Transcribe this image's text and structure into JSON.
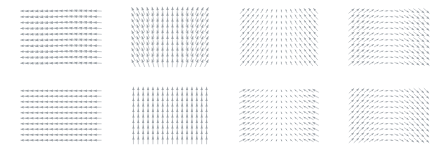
{
  "figure": {
    "title": "",
    "background_color": "#ffffff",
    "arrow_color": "#9aa0a6",
    "width": 441,
    "height": 151,
    "rows": 2,
    "cols": 4,
    "panel_count": 8
  },
  "chart_data": {
    "type": "quiver",
    "title": "",
    "xlabel": "",
    "ylabel": "",
    "grid": false,
    "legend": null,
    "axes_visible": false,
    "tick_labels": [],
    "layout": {
      "rows": 2,
      "cols": 4
    },
    "grid_shape": {
      "nx": 16,
      "ny": 10
    },
    "domain": {
      "xlim": [
        -1,
        1
      ],
      "ylim": [
        -1,
        1
      ]
    },
    "panels": [
      {
        "index": 0,
        "row": 0,
        "col": 0,
        "label": "",
        "field": "horizontal-leftward-wave",
        "description": "Near-horizontal arrows pointing left with a gentle vertical undulation; magnitude roughly uniform.",
        "u_expr": "-1",
        "v_expr": "0.22*sin(3.1*x)",
        "scale": 1.0,
        "bounds_px": {
          "x": 22,
          "y": 8,
          "w": 78,
          "h": 58
        }
      },
      {
        "index": 1,
        "row": 0,
        "col": 1,
        "label": "",
        "field": "vertical-fan-shear",
        "description": "Near-vertical arrows fanning: tilted backslash on the left, upright in the middle, forward slash on the right.",
        "u_expr": "0.55*x",
        "v_expr": "1",
        "scale": 1.0,
        "bounds_px": {
          "x": 131,
          "y": 8,
          "w": 78,
          "h": 58
        }
      },
      {
        "index": 2,
        "row": 0,
        "col": 2,
        "label": "",
        "field": "convergent-shear",
        "description": "Arrows tilt inward toward the vertical centre line; magnitude shrinks near the middle column.",
        "u_expr": "-0.75*x",
        "v_expr": "0.9",
        "scale": 0.85,
        "bounds_px": {
          "x": 240,
          "y": 8,
          "w": 78,
          "h": 58
        }
      },
      {
        "index": 3,
        "row": 0,
        "col": 3,
        "label": "",
        "field": "divergent-source",
        "description": "Forward-slash arrows on the left, flat horizontal through the centre, backslash on the right; outflow pattern.",
        "u_expr": "1",
        "v_expr": "-0.85*x",
        "scale": 0.9,
        "bounds_px": {
          "x": 349,
          "y": 8,
          "w": 80,
          "h": 58
        }
      },
      {
        "index": 4,
        "row": 1,
        "col": 0,
        "label": "",
        "field": "uniform-horizontal",
        "description": "Uniform horizontal arrows pointing left; constant magnitude across the grid.",
        "u_expr": "-1",
        "v_expr": "0",
        "scale": 0.95,
        "bounds_px": {
          "x": 22,
          "y": 88,
          "w": 78,
          "h": 55
        }
      },
      {
        "index": 5,
        "row": 1,
        "col": 1,
        "label": "",
        "field": "uniform-vertical",
        "description": "Uniform vertical arrows pointing up; constant magnitude across the grid.",
        "u_expr": "0",
        "v_expr": "1",
        "scale": 0.95,
        "bounds_px": {
          "x": 131,
          "y": 88,
          "w": 78,
          "h": 55
        }
      },
      {
        "index": 6,
        "row": 1,
        "col": 2,
        "label": "",
        "field": "convergent-sink",
        "description": "Arrows rotate from forward-slash on the left through vertical at the centre to backslash on the right; inflow/sink.",
        "u_expr": "-0.95*x",
        "v_expr": "0.45",
        "scale": 0.85,
        "bounds_px": {
          "x": 240,
          "y": 88,
          "w": 78,
          "h": 55
        }
      },
      {
        "index": 7,
        "row": 1,
        "col": 3,
        "label": "",
        "field": "divergent-saddle",
        "description": "Backslash arrows on the left, flattening through the centre, forward-slash on the right; outward saddle flow.",
        "u_expr": "0.95",
        "v_expr": "-0.95*x",
        "scale": 0.85,
        "bounds_px": {
          "x": 349,
          "y": 88,
          "w": 80,
          "h": 55
        }
      }
    ]
  }
}
